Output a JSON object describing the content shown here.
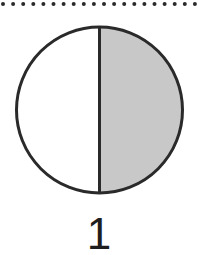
{
  "figure": {
    "type": "fraction-circle",
    "parts_total": 2,
    "parts_shaded": 1,
    "shaded_side": "right",
    "label": "1",
    "colors": {
      "stroke": "#2a2a2a",
      "shaded_fill": "#c8c8c8",
      "unshaded_fill": "#ffffff",
      "dots": "#2a2a2a"
    }
  },
  "separator": {
    "style": "dotted"
  }
}
